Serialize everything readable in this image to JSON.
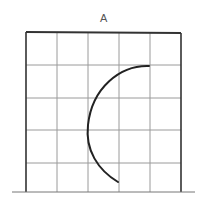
{
  "figure": {
    "label": "A",
    "grid": {
      "columns": 5,
      "rows": 5,
      "x_lines": [
        26,
        57,
        88,
        119,
        150,
        181
      ],
      "y_lines": [
        32,
        65,
        98,
        130,
        163,
        192
      ],
      "line_color": "#888888",
      "border_color": "#222222"
    },
    "baseline": {
      "x1": 12,
      "x2": 195,
      "y": 192
    },
    "arc": {
      "start": [
        149,
        66
      ],
      "end": [
        118,
        182
      ],
      "leftmost_x": 87,
      "color": "#222222",
      "stroke_width": 2
    }
  }
}
